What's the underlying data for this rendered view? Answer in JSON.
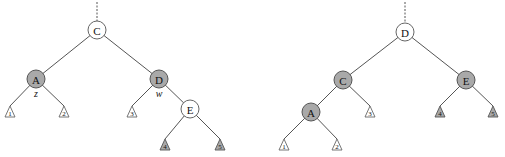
{
  "diagram": {
    "type": "tree-rotation",
    "trees": [
      {
        "id": "before",
        "nodes": [
          {
            "id": "C",
            "label": "C",
            "x": 97,
            "y": 30,
            "shaded": false,
            "parent_link": true
          },
          {
            "id": "A",
            "label": "A",
            "x": 36,
            "y": 79,
            "shaded": true,
            "tag": "z"
          },
          {
            "id": "D",
            "label": "D",
            "x": 159,
            "y": 79,
            "shaded": true,
            "tag": "w"
          },
          {
            "id": "E",
            "label": "E",
            "x": 190,
            "y": 109,
            "shaded": false
          }
        ],
        "subtrees": [
          {
            "label": "1",
            "x": 10,
            "y": 106,
            "shaded": false,
            "parent": "A"
          },
          {
            "label": "2",
            "x": 64,
            "y": 106,
            "shaded": false,
            "parent": "A"
          },
          {
            "label": "3",
            "x": 132,
            "y": 106,
            "shaded": false,
            "parent": "D"
          },
          {
            "label": "4",
            "x": 165,
            "y": 139,
            "shaded": true,
            "parent": "E"
          },
          {
            "label": "5",
            "x": 220,
            "y": 139,
            "shaded": true,
            "parent": "E"
          }
        ],
        "edges": [
          [
            "C",
            "A"
          ],
          [
            "C",
            "D"
          ],
          [
            "D",
            "E"
          ]
        ]
      },
      {
        "id": "after",
        "nodes": [
          {
            "id": "D",
            "label": "D",
            "x": 405,
            "y": 32,
            "shaded": false,
            "parent_link": true
          },
          {
            "id": "C",
            "label": "C",
            "x": 343,
            "y": 80,
            "shaded": true
          },
          {
            "id": "E",
            "label": "E",
            "x": 466,
            "y": 80,
            "shaded": true
          },
          {
            "id": "A",
            "label": "A",
            "x": 311,
            "y": 112,
            "shaded": true
          }
        ],
        "subtrees": [
          {
            "label": "1",
            "x": 284,
            "y": 139,
            "shaded": false,
            "parent": "A"
          },
          {
            "label": "2",
            "x": 337,
            "y": 139,
            "shaded": false,
            "parent": "A"
          },
          {
            "label": "3",
            "x": 370,
            "y": 106,
            "shaded": false,
            "parent": "C"
          },
          {
            "label": "4",
            "x": 440,
            "y": 106,
            "shaded": true,
            "parent": "E"
          },
          {
            "label": "5",
            "x": 493,
            "y": 106,
            "shaded": true,
            "parent": "E"
          }
        ],
        "edges": [
          [
            "D",
            "C"
          ],
          [
            "D",
            "E"
          ],
          [
            "C",
            "A"
          ]
        ]
      }
    ],
    "colors": {
      "shaded_fill": "#a9a9a9",
      "white_fill": "#ffffff",
      "stroke": "#555555"
    }
  }
}
